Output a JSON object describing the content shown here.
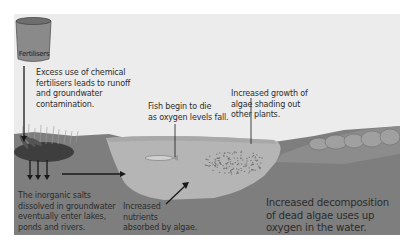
{
  "diagram": {
    "barrel_label": "Fertilisers",
    "labels": {
      "runoff": [
        "Excess use of chemical",
        "fertilisers leads to runoff",
        "and groundwater",
        "contamination."
      ],
      "fish": [
        "Fish begin to die",
        "as oxygen levels fall."
      ],
      "algae_growth": [
        "Increased growth of",
        "algae shading out",
        "other plants."
      ],
      "salts": [
        "The inorganic salts",
        "dissolved in groundwater",
        "eventually enter lakes,",
        "ponds and rivers."
      ],
      "nutrients": [
        "Increased",
        "nutrients",
        "absorbed by algae."
      ],
      "decomposition": [
        "Increased decomposition",
        "of dead algae uses up",
        "oxygen in the water."
      ]
    },
    "colors": {
      "sky": "#ececec",
      "soil": "#7d7d7d",
      "water": "#b4b4b4",
      "barrel": "#8a8a8a",
      "arrow": "#1a1a1a"
    }
  }
}
